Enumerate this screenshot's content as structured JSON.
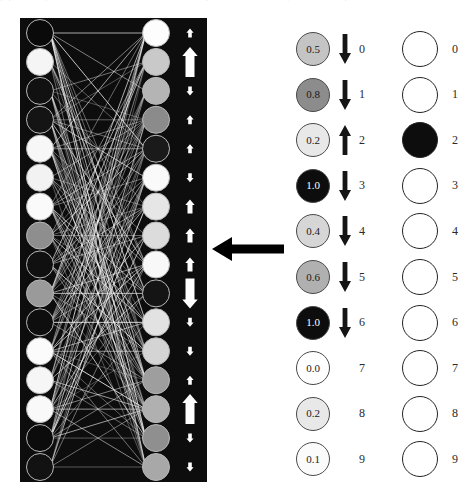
{
  "caption": {
    "text": "图表示意，其中左侧面板显示一个具有稠密连接的神经网络，右侧为激活值与输出单元。"
  },
  "network_panel": {
    "name": "neural-network-panel",
    "background_color": "#0d0d0d",
    "edge_color": "#f2f2f2",
    "left_nodes": [
      {
        "index": 0,
        "shade": "#0a0a0a"
      },
      {
        "index": 1,
        "shade": "#f5f5f5"
      },
      {
        "index": 2,
        "shade": "#111111"
      },
      {
        "index": 3,
        "shade": "#141414"
      },
      {
        "index": 4,
        "shade": "#f7f7f7"
      },
      {
        "index": 5,
        "shade": "#f2f2f2"
      },
      {
        "index": 6,
        "shade": "#fafafa"
      },
      {
        "index": 7,
        "shade": "#8e8e8e"
      },
      {
        "index": 8,
        "shade": "#101010"
      },
      {
        "index": 9,
        "shade": "#9a9a9a"
      },
      {
        "index": 10,
        "shade": "#0e0e0e"
      },
      {
        "index": 11,
        "shade": "#fbfbfb"
      },
      {
        "index": 12,
        "shade": "#f6f6f6"
      },
      {
        "index": 13,
        "shade": "#f9f9f9"
      },
      {
        "index": 14,
        "shade": "#0c0c0c"
      },
      {
        "index": 15,
        "shade": "#121212"
      }
    ],
    "right_nodes": [
      {
        "index": 0,
        "shade": "#fdfdfd"
      },
      {
        "index": 1,
        "shade": "#c9c9c9"
      },
      {
        "index": 2,
        "shade": "#b4b4b4"
      },
      {
        "index": 3,
        "shade": "#8b8b8b"
      },
      {
        "index": 4,
        "shade": "#1a1a1a"
      },
      {
        "index": 5,
        "shade": "#fafafa"
      },
      {
        "index": 6,
        "shade": "#e6e6e6"
      },
      {
        "index": 7,
        "shade": "#dcdcdc"
      },
      {
        "index": 8,
        "shade": "#f8f8f8"
      },
      {
        "index": 9,
        "shade": "#141414"
      },
      {
        "index": 10,
        "shade": "#e2e2e2"
      },
      {
        "index": 11,
        "shade": "#d4d4d4"
      },
      {
        "index": 12,
        "shade": "#9e9e9e"
      },
      {
        "index": 13,
        "shade": "#b0b0b0"
      },
      {
        "index": 14,
        "shade": "#8f8f8f"
      },
      {
        "index": 15,
        "shade": "#a8a8a8"
      }
    ],
    "side_arrows": [
      {
        "index": 0,
        "direction": "up",
        "size": "small"
      },
      {
        "index": 1,
        "direction": "up",
        "size": "large"
      },
      {
        "index": 2,
        "direction": "down",
        "size": "small"
      },
      {
        "index": 3,
        "direction": "up",
        "size": "small"
      },
      {
        "index": 4,
        "direction": "up",
        "size": "small"
      },
      {
        "index": 5,
        "direction": "down",
        "size": "small"
      },
      {
        "index": 6,
        "direction": "up",
        "size": "medium"
      },
      {
        "index": 7,
        "direction": "up",
        "size": "medium"
      },
      {
        "index": 8,
        "direction": "up",
        "size": "medium"
      },
      {
        "index": 9,
        "direction": "down",
        "size": "large"
      },
      {
        "index": 10,
        "direction": "down",
        "size": "small"
      },
      {
        "index": 11,
        "direction": "down",
        "size": "small"
      },
      {
        "index": 12,
        "direction": "up",
        "size": "small"
      },
      {
        "index": 13,
        "direction": "up",
        "size": "large"
      },
      {
        "index": 14,
        "direction": "down",
        "size": "small"
      },
      {
        "index": 15,
        "direction": "down",
        "size": "small"
      }
    ]
  },
  "transition_arrow": {
    "name": "leftward-transition-arrow",
    "direction": "left",
    "color": "#1c1c1c"
  },
  "value_column": {
    "name": "activation-value-column",
    "rows": [
      {
        "value": "0.5",
        "index": "0",
        "fill": "#c4c4c4",
        "text_color": "#1a1a1a",
        "arrow": "down"
      },
      {
        "value": "0.8",
        "index": "1",
        "fill": "#8c8c8c",
        "text_color": "#1a1a1a",
        "arrow": "down"
      },
      {
        "value": "0.2",
        "index": "2",
        "fill": "#e8e8e8",
        "text_color": "#1a1a1a",
        "arrow": "up"
      },
      {
        "value": "1.0",
        "index": "3",
        "fill": "#0d0d0d",
        "text_color": "#ffffff",
        "arrow": "down"
      },
      {
        "value": "0.4",
        "index": "4",
        "fill": "#d6d6d6",
        "text_color": "#1a1a1a",
        "arrow": "down"
      },
      {
        "value": "0.6",
        "index": "5",
        "fill": "#b0b0b0",
        "text_color": "#1a1a1a",
        "arrow": "down"
      },
      {
        "value": "1.0",
        "index": "6",
        "fill": "#0d0d0d",
        "text_color": "#ffffff",
        "arrow": "down"
      },
      {
        "value": "0.0",
        "index": "7",
        "fill": "#ffffff",
        "text_color": "#1a1a1a",
        "arrow": "none"
      },
      {
        "value": "0.2",
        "index": "8",
        "fill": "#e8e8e8",
        "text_color": "#1a1a1a",
        "arrow": "none"
      },
      {
        "value": "0.1",
        "index": "9",
        "fill": "#fbfbfb",
        "text_color": "#1a1a1a",
        "arrow": "none"
      }
    ]
  },
  "output_column": {
    "name": "output-unit-column",
    "rows": [
      {
        "index": "0",
        "fill": "#ffffff"
      },
      {
        "index": "1",
        "fill": "#ffffff"
      },
      {
        "index": "2",
        "fill": "#0d0d0d"
      },
      {
        "index": "3",
        "fill": "#ffffff"
      },
      {
        "index": "4",
        "fill": "#ffffff"
      },
      {
        "index": "5",
        "fill": "#ffffff"
      },
      {
        "index": "6",
        "fill": "#ffffff"
      },
      {
        "index": "7",
        "fill": "#ffffff"
      },
      {
        "index": "8",
        "fill": "#ffffff"
      },
      {
        "index": "9",
        "fill": "#ffffff"
      }
    ]
  }
}
